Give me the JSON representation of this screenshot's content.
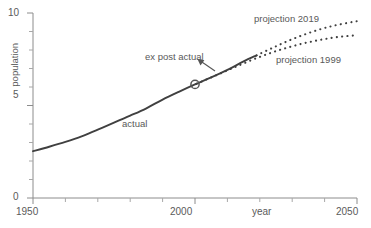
{
  "chart_data": {
    "type": "line",
    "title": "",
    "xlabel": "year",
    "ylabel": "population",
    "xlim": [
      1950,
      2050
    ],
    "ylim": [
      0,
      10
    ],
    "grid": false,
    "legend": "inline-annotations",
    "x_ticks_major": [
      "1950",
      "2000",
      "2050"
    ],
    "x_ticks_major_values": [
      1950,
      2000,
      2050
    ],
    "x_ticks_minor_values": [
      1960,
      1970,
      1980,
      1990,
      2010,
      2020,
      2030,
      2040
    ],
    "y_ticks_major": [
      "0",
      "5",
      "10"
    ],
    "y_ticks_major_values": [
      0,
      5,
      10
    ],
    "y_ticks_minor_values": [
      1,
      2,
      3,
      4,
      6,
      7,
      8,
      9
    ],
    "series": [
      {
        "name": "actual",
        "style": "solid",
        "color": "#404040",
        "x": [
          1950,
          1955,
          1960,
          1965,
          1970,
          1975,
          1980,
          1985,
          1990,
          1995,
          2000,
          2005,
          2010,
          2015,
          2019
        ],
        "values": [
          2.53,
          2.77,
          3.03,
          3.33,
          3.7,
          4.07,
          4.45,
          4.85,
          5.32,
          5.74,
          6.14,
          6.52,
          6.93,
          7.38,
          7.71
        ]
      },
      {
        "name": "projection 2019",
        "style": "dotted",
        "color": "#404040",
        "x": [
          2019,
          2024,
          2029,
          2034,
          2039,
          2044,
          2050
        ],
        "values": [
          7.71,
          8.12,
          8.51,
          8.85,
          9.14,
          9.36,
          9.56
        ]
      },
      {
        "name": "projection 1999",
        "style": "dotted",
        "color": "#404040",
        "x": [
          1999,
          2004,
          2009,
          2014,
          2019,
          2024,
          2029,
          2034,
          2039,
          2044,
          2050
        ],
        "values": [
          6.06,
          6.44,
          6.82,
          7.2,
          7.56,
          7.88,
          8.15,
          8.38,
          8.56,
          8.7,
          8.8
        ]
      }
    ],
    "markers": [
      {
        "name": "ex post actual",
        "shape": "circle-open",
        "x": 2000,
        "value": 6.14
      }
    ],
    "annotations": [
      {
        "text": "actual",
        "x": 1987,
        "value": 4.05
      },
      {
        "text": "ex post actual",
        "x": 1994,
        "value": 7.4,
        "arrow_to_x": 2004,
        "arrow_to_value": 6.55
      },
      {
        "text": "projection 2019",
        "x": 2015,
        "value": 9.25
      },
      {
        "text": "projection 1999",
        "x": 2023,
        "value": 7.35
      }
    ]
  },
  "axes": {
    "y_title": "population",
    "x_title": "year",
    "y_labels": {
      "top": "10",
      "mid": "5",
      "bottom": "0"
    },
    "x_labels": {
      "left": "1950",
      "mid": "2000",
      "right": "2050"
    }
  },
  "labels": {
    "actual": "actual",
    "ex_post_actual": "ex post actual",
    "projection_2019": "projection 2019",
    "projection_1999": "projection 1999"
  },
  "colors": {
    "line": "#404040",
    "axis": "#8c8c8c",
    "text": "#595959",
    "background": "#ffffff"
  }
}
